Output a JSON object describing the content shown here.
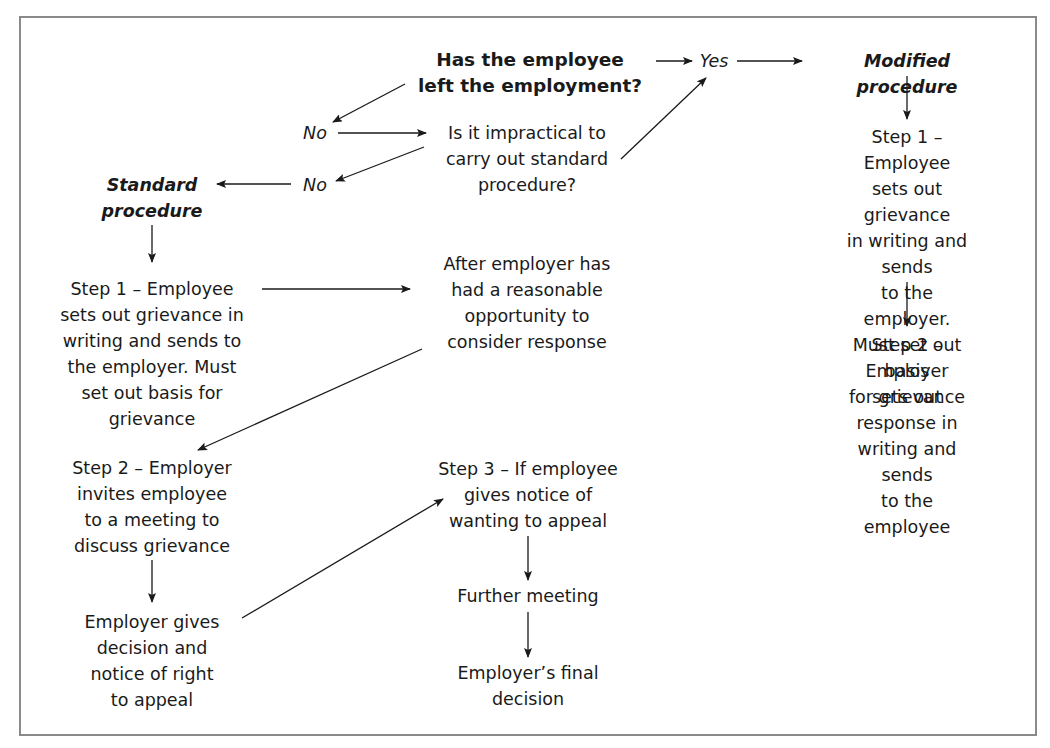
{
  "diagram": {
    "type": "flowchart",
    "nodes": {
      "question_left": "Has the employee\nleft the employment?",
      "yes": "Yes",
      "modified_procedure": "Modified procedure",
      "no_1": "No",
      "question_impractical": "Is it impractical to\ncarry out standard\nprocedure?",
      "no_2": "No",
      "standard_procedure": "Standard\nprocedure",
      "std_step1": "Step 1 – Employee\nsets out grievance in\nwriting and sends to\nthe employer. Must\nset out basis for\ngrievance",
      "after_employer": "After employer has\nhad a reasonable\nopportunity to\nconsider response",
      "std_step2": "Step 2 – Employer\ninvites employee\nto a meeting to\ndiscuss grievance",
      "employer_decision": "Employer gives\ndecision and\nnotice of right\nto appeal",
      "std_step3": "Step 3 – If employee\ngives notice of\nwanting to appeal",
      "further_meeting": "Further meeting",
      "final_decision": "Employer’s final\ndecision",
      "mod_step1": "Step 1 – Employee\nsets out grievance\nin writing and sends\nto the employer.\nMust set out basis\nfor grievance",
      "mod_step2": "Step 2 – Employer\nsets out response in\nwriting and sends\nto the employee"
    },
    "edges": [
      [
        "question_left",
        "yes"
      ],
      [
        "yes",
        "modified_procedure"
      ],
      [
        "question_left",
        "no_1"
      ],
      [
        "no_1",
        "question_impractical"
      ],
      [
        "question_impractical",
        "yes"
      ],
      [
        "question_impractical",
        "no_2"
      ],
      [
        "no_2",
        "standard_procedure"
      ],
      [
        "standard_procedure",
        "std_step1"
      ],
      [
        "std_step1",
        "after_employer"
      ],
      [
        "after_employer",
        "std_step2"
      ],
      [
        "std_step2",
        "employer_decision"
      ],
      [
        "employer_decision",
        "std_step3"
      ],
      [
        "std_step3",
        "further_meeting"
      ],
      [
        "further_meeting",
        "final_decision"
      ],
      [
        "modified_procedure",
        "mod_step1"
      ],
      [
        "mod_step1",
        "mod_step2"
      ]
    ],
    "colors": {
      "border": "#8a8a8a",
      "text": "#1a1a1a",
      "line": "#1a1a1a"
    }
  }
}
